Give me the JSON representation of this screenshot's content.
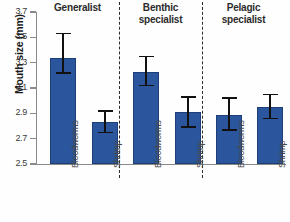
{
  "chart_data": {
    "type": "bar",
    "title": "",
    "xlabel": "",
    "ylabel": "Mouth size (mm)",
    "ylim": [
      2.5,
      3.7
    ],
    "ytick_step": 0.2,
    "yticks": [
      "3.7",
      "3.5",
      "3.3",
      "3.1",
      "2.9",
      "2.7",
      "2.5"
    ],
    "grid": false,
    "legend": "none",
    "error_bars": "yes",
    "group_dividers": "dashed vertical lines between groups",
    "bar_color": "#2b559c",
    "error_color": "#111111",
    "axis_color": "#8a8a8a",
    "groups": [
      "Generalist",
      "Benthic specialist",
      "Pelagic specialist"
    ],
    "categories": [
      "Bloodworms",
      "Shrimp"
    ],
    "bars": [
      {
        "group": "Generalist",
        "category": "Bloodworms",
        "value": 3.34,
        "err_low": 3.22,
        "err_high": 3.53
      },
      {
        "group": "Generalist",
        "category": "Shrimp",
        "value": 2.83,
        "err_low": 2.75,
        "err_high": 2.92
      },
      {
        "group": "Benthic specialist",
        "category": "Bloodworms",
        "value": 3.23,
        "err_low": 3.12,
        "err_high": 3.35
      },
      {
        "group": "Benthic specialist",
        "category": "Shrimp",
        "value": 2.91,
        "err_low": 2.79,
        "err_high": 3.03
      },
      {
        "group": "Pelagic specialist",
        "category": "Bloodworms",
        "value": 2.89,
        "err_low": 2.77,
        "err_high": 3.02
      },
      {
        "group": "Pelagic specialist",
        "category": "Shrimp",
        "value": 2.95,
        "err_low": 2.86,
        "err_high": 3.05
      }
    ]
  },
  "axis": {
    "y_title": "Mouth size (mm)"
  },
  "groups": [
    {
      "label_line1": "Generalist",
      "label_line2": ""
    },
    {
      "label_line1": "Benthic",
      "label_line2": "specialist"
    },
    {
      "label_line1": "Pelagic",
      "label_line2": "specialist"
    }
  ],
  "cat_labels": [
    "Bloodworms",
    "Shrimp",
    "Bloodworms",
    "Shrimp",
    "Bloodworms",
    "Shrimp"
  ]
}
